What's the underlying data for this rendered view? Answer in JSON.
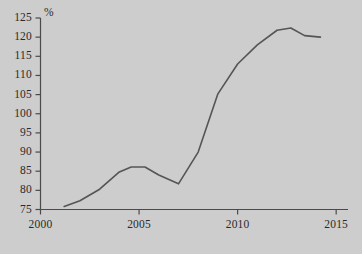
{
  "chart_data": {
    "type": "line",
    "title": "",
    "xlabel": "",
    "ylabel": "",
    "unit_label": "%",
    "grid": false,
    "legend": "none",
    "xlim": [
      2000,
      2015.6
    ],
    "ylim": [
      75,
      125
    ],
    "xticks": [
      2000,
      2005,
      2010,
      2015
    ],
    "xtick_labels": [
      "2000",
      "2005",
      "2010",
      "2015"
    ],
    "yticks": [
      75,
      80,
      85,
      90,
      95,
      100,
      105,
      110,
      115,
      120,
      125
    ],
    "ytick_labels": [
      "75",
      "80",
      "85",
      "90",
      "95",
      "100",
      "105",
      "110",
      "115",
      "120",
      "125"
    ],
    "series": [
      {
        "name": "index",
        "color": "#555555",
        "x": [
          2001.2,
          2002.0,
          2003.0,
          2004.0,
          2004.6,
          2005.3,
          2006.0,
          2007.0,
          2008.0,
          2009.0,
          2010.0,
          2011.0,
          2012.0,
          2012.7,
          2013.4,
          2014.2
        ],
        "values": [
          75.8,
          77.3,
          80.3,
          84.8,
          86.1,
          86.1,
          84.0,
          81.7,
          90.0,
          105.2,
          113.0,
          118.0,
          121.8,
          122.4,
          120.4,
          120.0
        ]
      }
    ]
  },
  "axes": {
    "axis_color": "#4a4a4a",
    "background": "#cdcdcd"
  }
}
